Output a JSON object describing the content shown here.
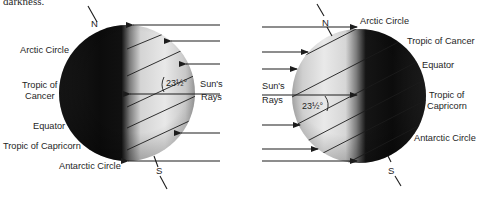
{
  "caption_fragment": "darkness.",
  "colors": {
    "dark_side": "#0f0f0f",
    "lit_side": "#e6e6e6",
    "lit_edge": "#9a9a9a",
    "line": "#1c1c1c",
    "background": "#ffffff"
  },
  "left_globe": {
    "description": "Northern hemisphere winter solstice: sun rays from the right, north pole tilted away",
    "sun_direction": "right",
    "pole_north": "N",
    "pole_south": "S",
    "labels": {
      "arctic_circle": "Arctic Circle",
      "tropic_cancer_1": "Tropic of",
      "tropic_cancer_2": "Cancer",
      "equator": "Equator",
      "tropic_capricorn": "Tropic of Capricorn",
      "antarctic_circle": "Antarctic Circle"
    },
    "angle": "23½°",
    "sun_rays_1": "Sun's",
    "sun_rays_2": "Rays"
  },
  "right_globe": {
    "description": "Northern hemisphere summer solstice: sun rays from the left, north pole tilted toward sun",
    "sun_direction": "left",
    "pole_north": "N",
    "pole_south": "S",
    "labels": {
      "arctic_circle": "Arctic Circle",
      "tropic_cancer": "Tropic of Cancer",
      "equator": "Equator",
      "tropic_capricorn_1": "Tropic of",
      "tropic_capricorn_2": "Capricorn",
      "antarctic_circle": "Antarctic Circle"
    },
    "angle": "23½°",
    "sun_rays_1": "Sun's",
    "sun_rays_2": "Rays"
  }
}
